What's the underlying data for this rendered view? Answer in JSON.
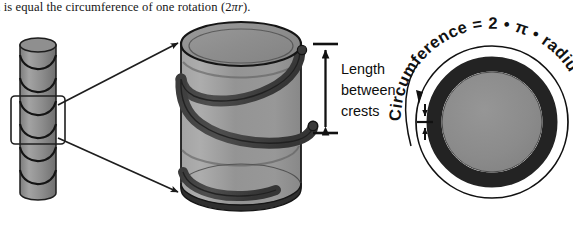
{
  "figure": {
    "caption": "h is equal the circumference of one rotation (2πr).",
    "caption_visible_prefix": "h is equal the circumference of one rotation (2",
    "caption_math": "πr",
    "caption_suffix": ")."
  },
  "left_diagram": {
    "name": "threaded-rod",
    "description": "small helically threaded cylinder with a selection box around the middle thread",
    "thread_count": 6
  },
  "center_diagram": {
    "name": "large-cylinder-with-helix",
    "description": "enlarged translucent cylinder showing one full helical turn",
    "body_color": "#8a8a8a",
    "helix_color": "#3a3a3a",
    "outline_color": "#1a1a1a"
  },
  "crest_label": {
    "line1": "Length",
    "line2": "between",
    "line3": "crests"
  },
  "right_diagram": {
    "name": "circle-cross-section",
    "curved_label": "Circumference = 2 * π * radius",
    "curved_label_chars": "Circumference = 2 • π • radius",
    "ring_color": "#232323",
    "fill_color": "#8a8a8a",
    "outline_color": "#111111"
  },
  "colors": {
    "background": "#ffffff",
    "ink": "#111111",
    "gray_body": "#8a8a8a",
    "gray_light": "#9d9d9d",
    "gray_dark": "#4a4a4a",
    "near_black": "#232323"
  }
}
